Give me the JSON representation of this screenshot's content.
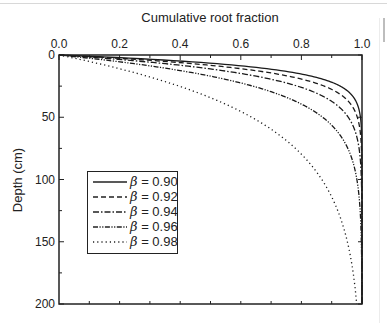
{
  "chart_data": {
    "type": "line",
    "title": "",
    "xlabel": "Cumulative root fraction",
    "ylabel": "Depth (cm)",
    "xlim": [
      0.0,
      1.0
    ],
    "ylim": [
      0,
      200
    ],
    "y_inverted": true,
    "x_axis_position": "top",
    "x_ticks": [
      "0.0",
      "0.2",
      "0.4",
      "0.6",
      "0.8",
      "1.0"
    ],
    "y_ticks": [
      "0",
      "50",
      "100",
      "150",
      "200"
    ],
    "grid": false,
    "legend_position": "lower-left inside",
    "model": "Y = 1 - beta^d",
    "series": [
      {
        "name": "β = 0.90",
        "beta": 0.9,
        "style": "solid",
        "x": [
          0,
          0.41,
          0.65,
          0.79,
          0.88,
          0.94,
          0.99,
          1.0,
          1.0,
          1.0
        ],
        "depth": [
          0,
          5,
          10,
          15,
          20,
          27,
          50,
          100,
          150,
          200
        ]
      },
      {
        "name": "β = 0.92",
        "beta": 0.92,
        "style": "dashed",
        "x": [
          0,
          0.34,
          0.57,
          0.71,
          0.81,
          0.89,
          0.98,
          1.0,
          1.0,
          1.0
        ],
        "depth": [
          0,
          5,
          10,
          15,
          20,
          27,
          50,
          100,
          150,
          200
        ]
      },
      {
        "name": "β = 0.94",
        "beta": 0.94,
        "style": "dash-dot",
        "x": [
          0,
          0.27,
          0.46,
          0.6,
          0.71,
          0.81,
          0.95,
          1.0,
          1.0,
          1.0
        ],
        "depth": [
          0,
          5,
          10,
          15,
          20,
          27,
          50,
          100,
          150,
          200
        ]
      },
      {
        "name": "β = 0.96",
        "beta": 0.96,
        "style": "dash-dot-dot",
        "x": [
          0,
          0.18,
          0.34,
          0.46,
          0.56,
          0.67,
          0.87,
          0.98,
          1.0,
          1.0
        ],
        "depth": [
          0,
          5,
          10,
          15,
          20,
          27,
          50,
          100,
          150,
          200
        ]
      },
      {
        "name": "β = 0.98",
        "beta": 0.98,
        "style": "dotted",
        "x": [
          0,
          0.1,
          0.18,
          0.26,
          0.33,
          0.42,
          0.64,
          0.87,
          0.95,
          0.98
        ],
        "depth": [
          0,
          5,
          10,
          15,
          20,
          27,
          50,
          100,
          150,
          200
        ]
      }
    ]
  },
  "legend": [
    {
      "symbol": "β",
      "value": "= 0.90"
    },
    {
      "symbol": "β",
      "value": "= 0.92"
    },
    {
      "symbol": "β",
      "value": "= 0.94"
    },
    {
      "symbol": "β",
      "value": "= 0.96"
    },
    {
      "symbol": "β",
      "value": "= 0.98"
    }
  ]
}
